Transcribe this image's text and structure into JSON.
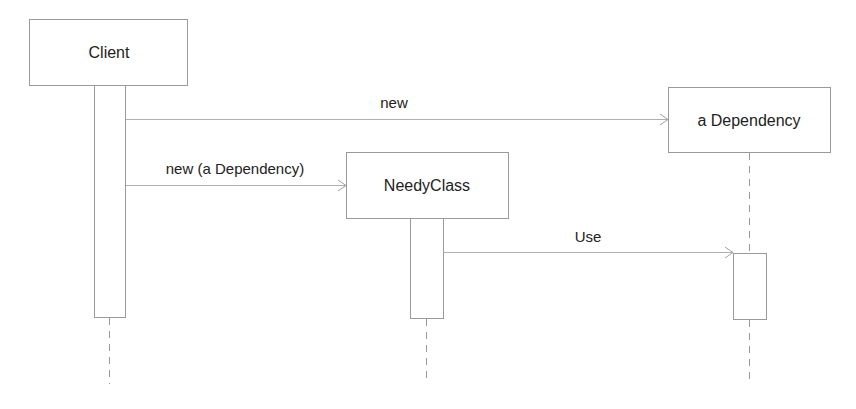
{
  "diagram": {
    "type": "sequence",
    "participants": [
      {
        "id": "client",
        "label": "Client"
      },
      {
        "id": "dependency",
        "label": "a Dependency"
      },
      {
        "id": "needy",
        "label": "NeedyClass"
      }
    ],
    "messages": [
      {
        "from": "client",
        "to": "dependency",
        "label": "new"
      },
      {
        "from": "client",
        "to": "needy",
        "label": "new (a Dependency)"
      },
      {
        "from": "needy",
        "to": "dependency",
        "label": "Use"
      }
    ],
    "colors": {
      "line": "#9a9a9a",
      "text": "#222222",
      "background": "#ffffff"
    }
  }
}
